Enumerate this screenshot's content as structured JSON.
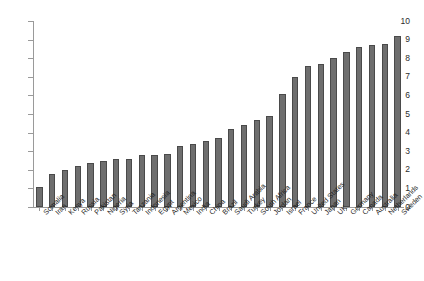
{
  "chart_data": {
    "type": "bar",
    "title": "",
    "xlabel": "",
    "ylabel": "",
    "ylim": [
      0,
      10
    ],
    "ytick_labels": [
      "0",
      "1",
      "2",
      "3",
      "4",
      "5",
      "6",
      "7",
      "8",
      "9",
      "10"
    ],
    "ytick_values": [
      0,
      1,
      2,
      3,
      4,
      5,
      6,
      7,
      8,
      9,
      10
    ],
    "grid": false,
    "legend": "none",
    "bar_color": "#6e6e6e",
    "axis_color": "#9a9a9a",
    "categories": [
      "Somalia",
      "Iran",
      "Kenya",
      "Russia",
      "Pakistan",
      "Nigeria",
      "Syria",
      "Tanzania",
      "Indonesia",
      "Egypt",
      "Argentina",
      "Mexico",
      "India",
      "China",
      "Brazil",
      "Saudi Arabia",
      "Turkey",
      "South Africa",
      "Jordan",
      "Israel",
      "France",
      "United States",
      "Japan",
      "UK",
      "Germany",
      "Canada",
      "Australia",
      "Netherlands",
      "Sweden"
    ],
    "values": [
      1.1,
      1.8,
      2.0,
      2.2,
      2.35,
      2.5,
      2.6,
      2.6,
      2.8,
      2.8,
      2.85,
      3.3,
      3.4,
      3.55,
      3.7,
      4.2,
      4.4,
      4.7,
      4.9,
      6.1,
      7.0,
      7.6,
      7.7,
      8.0,
      8.35,
      8.6,
      8.7,
      8.75,
      9.2
    ]
  }
}
